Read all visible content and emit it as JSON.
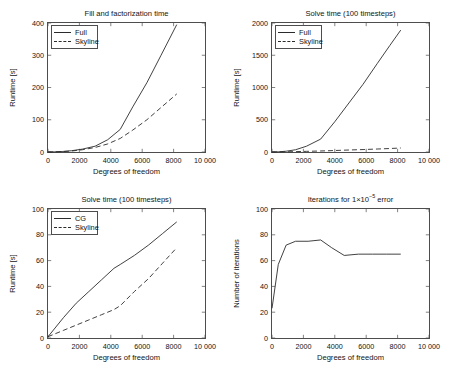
{
  "figure": {
    "background": "#ffffff",
    "line_color": "#2b2b2b",
    "axis_color": "#4d4d4d"
  },
  "panels": [
    {
      "id": "fill-and-factorization-time",
      "title": "Fill and factorization time",
      "title_prefix": "Fill and factorization time",
      "xlabel": "Degrees of freedom",
      "ylabel": "Runtime [s]",
      "xticks": [
        "0",
        "2000",
        "4000",
        "6000",
        "8000",
        "10 000"
      ],
      "yticks": [
        "0",
        "100",
        "200",
        "300",
        "400"
      ],
      "legend": [
        {
          "label": "Full",
          "style": "solid"
        },
        {
          "label": "Skyline",
          "style": "dashed"
        }
      ]
    },
    {
      "id": "solve-time-full-vs-skyline",
      "title": "Solve time (100 timesteps)",
      "title_prefix": "Solve time (100 timesteps)",
      "xlabel": "Degrees of freedom",
      "ylabel": "Runtime [s]",
      "xticks": [
        "0",
        "2000",
        "4000",
        "6000",
        "8000",
        "10 000"
      ],
      "yticks": [
        "0",
        "500",
        "1000",
        "1500",
        "2000"
      ],
      "legend": [
        {
          "label": "Full",
          "style": "solid"
        },
        {
          "label": "Skyline",
          "style": "dashed"
        }
      ]
    },
    {
      "id": "solve-time-cg-vs-skyline",
      "title": "Solve time (100 timesteps)",
      "title_prefix": "Solve time (100 timesteps)",
      "xlabel": "Degrees of freedom",
      "ylabel": "Runtime [s]",
      "xticks": [
        "0",
        "2000",
        "4000",
        "6000",
        "8000",
        "10 000"
      ],
      "yticks": [
        "0",
        "20",
        "40",
        "60",
        "80",
        "100"
      ],
      "legend": [
        {
          "label": "CG",
          "style": "solid"
        },
        {
          "label": "Skyline",
          "style": "dashed"
        }
      ]
    },
    {
      "id": "iterations-for-error",
      "title": "Iterations for 1×10⁻⁵ error",
      "title_prefix": "Iterations for 1×10",
      "title_exponent": "−5",
      "title_suffix": " error",
      "xlabel": "Degrees of freedom",
      "ylabel": "Number of iterations",
      "xticks": [
        "0",
        "2000",
        "4000",
        "6000",
        "8000",
        "10 000"
      ],
      "yticks": [
        "0",
        "20",
        "40",
        "60",
        "80",
        "100"
      ],
      "legend": []
    }
  ],
  "chart_data": [
    {
      "type": "line",
      "title": "Fill and factorization time",
      "xlabel": "Degrees of freedom",
      "ylabel": "Runtime [s]",
      "xlim": [
        0,
        10000
      ],
      "ylim": [
        0,
        400
      ],
      "xticks": [
        0,
        2000,
        4000,
        6000,
        8000,
        10000
      ],
      "yticks": [
        0,
        100,
        200,
        300,
        400
      ],
      "grid": false,
      "legend_position": "upper left",
      "series": [
        {
          "name": "Full",
          "style": "solid",
          "x": [
            0,
            400,
            900,
            1500,
            2200,
            3000,
            3800,
            4600,
            5400,
            6300,
            7200,
            8200
          ],
          "y": [
            0,
            0.5,
            1.5,
            4,
            9,
            18,
            38,
            70,
            140,
            215,
            300,
            395
          ]
        },
        {
          "name": "Skyline",
          "style": "dashed",
          "x": [
            0,
            400,
            900,
            1500,
            2200,
            3000,
            3800,
            4600,
            5400,
            6300,
            7200,
            8200
          ],
          "y": [
            0,
            0.4,
            1.2,
            3,
            7,
            14,
            25,
            42,
            68,
            100,
            138,
            180
          ]
        }
      ]
    },
    {
      "type": "line",
      "title": "Solve time (100 timesteps)",
      "xlabel": "Degrees of freedom",
      "ylabel": "Runtime [s]",
      "xlim": [
        0,
        10000
      ],
      "ylim": [
        0,
        2000
      ],
      "xticks": [
        0,
        2000,
        4000,
        6000,
        8000,
        10000
      ],
      "yticks": [
        0,
        500,
        1000,
        1500,
        2000
      ],
      "grid": false,
      "legend_position": "upper left",
      "series": [
        {
          "name": "Full",
          "style": "solid",
          "x": [
            0,
            400,
            900,
            1500,
            2200,
            3100,
            4000,
            4900,
            5800,
            6700,
            7500,
            8200
          ],
          "y": [
            0,
            3,
            12,
            35,
            90,
            200,
            470,
            760,
            1050,
            1370,
            1650,
            1890
          ]
        },
        {
          "name": "Skyline",
          "style": "dashed",
          "x": [
            0,
            400,
            900,
            1500,
            2200,
            3100,
            4000,
            4900,
            5800,
            6700,
            7500,
            8200
          ],
          "y": [
            0,
            1,
            3,
            6,
            10,
            16,
            23,
            31,
            38,
            46,
            54,
            62
          ]
        }
      ]
    },
    {
      "type": "line",
      "title": "Solve time (100 timesteps)",
      "xlabel": "Degrees of freedom",
      "ylabel": "Runtime [s]",
      "xlim": [
        0,
        10000
      ],
      "ylim": [
        0,
        100
      ],
      "xticks": [
        0,
        2000,
        4000,
        6000,
        8000,
        10000
      ],
      "yticks": [
        0,
        20,
        40,
        60,
        80,
        100
      ],
      "grid": false,
      "legend_position": "upper left",
      "series": [
        {
          "name": "CG",
          "style": "solid",
          "x": [
            0,
            400,
            1000,
            1800,
            2600,
            3400,
            4200,
            4600,
            5500,
            6400,
            7300,
            8200
          ],
          "y": [
            1,
            7,
            16,
            27,
            36,
            45,
            54,
            57,
            64,
            72,
            81,
            90
          ]
        },
        {
          "name": "Skyline",
          "style": "dashed",
          "x": [
            0,
            400,
            1000,
            1800,
            2600,
            3400,
            4200,
            4600,
            5500,
            6400,
            7300,
            8200
          ],
          "y": [
            1,
            3,
            6,
            10,
            14,
            18,
            22,
            25,
            36,
            46,
            58,
            70
          ]
        }
      ]
    },
    {
      "type": "line",
      "title": "Iterations for 1×10⁻⁵ error",
      "xlabel": "Degrees of freedom",
      "ylabel": "Number of iterations",
      "xlim": [
        0,
        10000
      ],
      "ylim": [
        0,
        100
      ],
      "xticks": [
        0,
        2000,
        4000,
        6000,
        8000,
        10000
      ],
      "yticks": [
        0,
        20,
        40,
        60,
        80,
        100
      ],
      "grid": false,
      "legend_position": "none",
      "series": [
        {
          "name": "Number of iterations",
          "style": "solid",
          "x": [
            0,
            400,
            900,
            1500,
            2300,
            3100,
            3800,
            4600,
            5500,
            6400,
            7300,
            8200
          ],
          "y": [
            23,
            57,
            72,
            75,
            75,
            76,
            70,
            64,
            65,
            65,
            65,
            65
          ]
        }
      ]
    }
  ]
}
